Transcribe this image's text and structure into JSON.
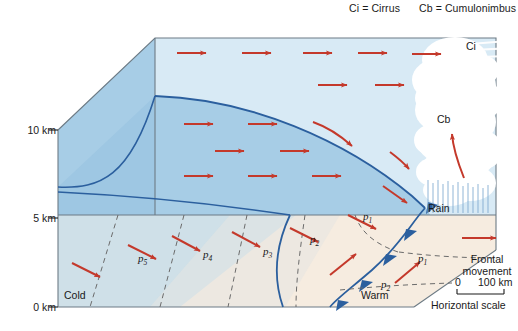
{
  "legend": {
    "cirrus_abbr": "Ci = Cirrus",
    "cumulonimbus_abbr": "Cb = Cumulonimbus"
  },
  "axis": {
    "title": "Altitude",
    "ticks": [
      "10 km",
      "5 km",
      "0 km"
    ],
    "values_km": [
      10,
      5,
      0
    ]
  },
  "cloud_labels": {
    "cirrus": "Ci",
    "cumulonimbus": "Cb",
    "rain": "Rain"
  },
  "airmass_labels": {
    "cold": "Cold",
    "warm": "Warm"
  },
  "isobars": {
    "ground_cold": [
      "p5",
      "p4",
      "p3"
    ],
    "ground_warm_upper": [
      "p2",
      "p1"
    ],
    "ground_warm_right": [
      "p1",
      "p2"
    ],
    "subscripts": {
      "p5": "5",
      "p4": "4",
      "p3": "3",
      "p2": "2",
      "p1": "1"
    },
    "base": "p"
  },
  "frontal_movement": {
    "line1": "Frontal",
    "line2": "movement"
  },
  "scale": {
    "start": "0",
    "end": "100 km",
    "caption": "Horizontal scale"
  },
  "colors": {
    "upper_air": "#d8eaf5",
    "cold_air_wedge": "#a7cde6",
    "cold_ground": "#cfe0e8",
    "warm_ground": "#f6ece0",
    "front_line": "#2b5f9e",
    "arrow_red": "#c4392b",
    "cloud_white": "#ffffff",
    "rain_blue": "#7fa9d0",
    "isobar_dash": "#6b6b6b",
    "box_edge": "#6d7b85",
    "text": "#1a1a1a"
  }
}
